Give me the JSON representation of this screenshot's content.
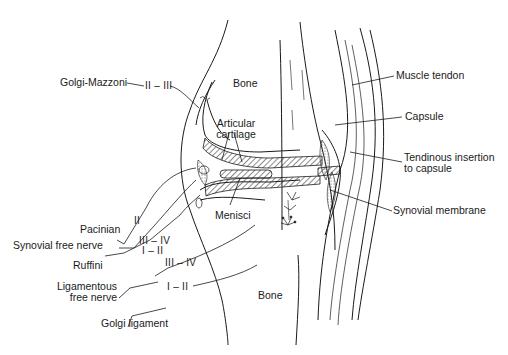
{
  "figure": {
    "structures": {
      "bone_top": "Bone",
      "bone_bottom": "Bone",
      "articular_cartilage": [
        "Articular",
        "cartilage"
      ],
      "menisci": "Menisci",
      "muscle_tendon": "Muscle tendon",
      "capsule": "Capsule",
      "tendinous_insertion": [
        "Tendinous insertion",
        "to capsule"
      ],
      "synovial_membrane": "Synovial membrane"
    },
    "receptors": [
      {
        "name": "Golgi-Mazzoni",
        "type": "II – III"
      },
      {
        "name": "Pacinian",
        "type": "II"
      },
      {
        "name": "Synovial free nerve",
        "type": "III – IV"
      },
      {
        "name": "Ruffini",
        "type": "I – II"
      },
      {
        "name": "Ligamentous free nerve",
        "name_lines": [
          "Ligamentous",
          "free nerve"
        ],
        "type": "III – IV"
      },
      {
        "name": "Golgi ligament",
        "type": "I – II"
      }
    ]
  },
  "colors": {
    "line": "#1a1a1a",
    "background": "#ffffff"
  }
}
